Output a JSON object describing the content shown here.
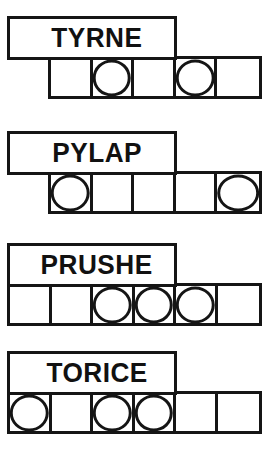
{
  "page": {
    "background_color": "#ffffff",
    "ink_color": "#151515"
  },
  "blocks": [
    {
      "label": "TYRNE",
      "label_box": {
        "x": 7,
        "y": 16,
        "width": 170,
        "height": 44
      },
      "grid": {
        "x": 48,
        "y": 56,
        "width": 214,
        "height": 43,
        "cells": 5
      },
      "cell_marks": [
        "",
        "circle",
        "",
        "circle",
        ""
      ]
    },
    {
      "label": "PYLAP",
      "label_box": {
        "x": 7,
        "y": 131,
        "width": 170,
        "height": 44
      },
      "grid": {
        "x": 48,
        "y": 171,
        "width": 214,
        "height": 43,
        "cells": 5
      },
      "cell_marks": [
        "circle",
        "",
        "",
        "",
        "circle"
      ]
    },
    {
      "label": "PRUSHE",
      "label_box": {
        "x": 7,
        "y": 243,
        "width": 170,
        "height": 44
      },
      "grid": {
        "x": 7,
        "y": 283,
        "width": 255,
        "height": 43,
        "cells": 6
      },
      "cell_marks": [
        "",
        "",
        "circle",
        "circle",
        "circle",
        ""
      ]
    },
    {
      "label": "TORICE",
      "label_box": {
        "x": 7,
        "y": 351,
        "width": 170,
        "height": 44
      },
      "grid": {
        "x": 7,
        "y": 391,
        "width": 255,
        "height": 43,
        "cells": 6
      },
      "cell_marks": [
        "circle",
        "",
        "circle",
        "circle",
        "",
        ""
      ]
    }
  ]
}
